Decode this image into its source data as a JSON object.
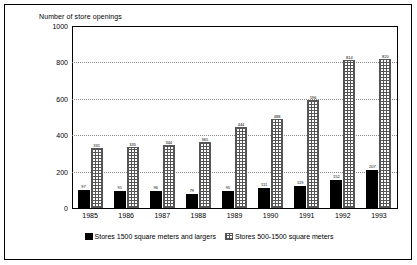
{
  "chart_data": {
    "type": "bar",
    "title": "Number of store openings",
    "xlabel": "",
    "ylabel": "",
    "ylim": [
      0,
      1000
    ],
    "yticks": [
      0,
      200,
      400,
      600,
      800,
      1000
    ],
    "grid": true,
    "legend_position": "bottom",
    "categories": [
      "1985",
      "1986",
      "1987",
      "1988",
      "1989",
      "1990",
      "1991",
      "1992",
      "1993"
    ],
    "series": [
      {
        "name": "Stores 1500 square meters and largers",
        "pattern": "solid-black",
        "values": [
          97,
          91,
          96,
          79,
          95,
          111,
          119,
          152,
          207
        ]
      },
      {
        "name": "Stores 500-1500 square meters",
        "pattern": "dotted-fill",
        "values": [
          331,
          335,
          344,
          365,
          444,
          488,
          596,
          814,
          820
        ]
      }
    ]
  },
  "legend": {
    "items": [
      {
        "label": "Stores 1500 square meters and largers"
      },
      {
        "label": "Stores 500-1500 square meters"
      }
    ]
  }
}
